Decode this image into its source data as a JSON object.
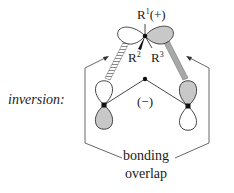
{
  "diagram": {
    "side_label": "inversion:",
    "top_substituent": "R",
    "top_substituent_sup": "1",
    "top_charge": "(+)",
    "substituent_left": "R",
    "substituent_left_sup": "2",
    "substituent_right": "R",
    "substituent_right_sup": "3",
    "center_charge": "(−)",
    "caption_line1": "bonding",
    "caption_line2": "overlap",
    "colors": {
      "line": "#3a3a3a",
      "shaded_lobe": "#c8c8c8",
      "white_lobe": "#ffffff",
      "atom_dot": "#111111",
      "hatched_bond": "#9a9a9a"
    }
  }
}
